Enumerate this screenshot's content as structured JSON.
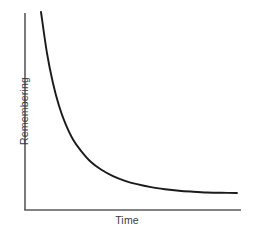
{
  "chart_data": {
    "type": "line",
    "title": "",
    "subtitle": "",
    "xlabel": "Time",
    "ylabel": "Remembering",
    "grid": false,
    "legend": null,
    "ticks": {
      "x": [],
      "y": []
    },
    "xlim": [
      0,
      100
    ],
    "ylim": [
      0,
      100
    ],
    "annotations": [],
    "line_color": "#1a1a1a",
    "axis_color": "#5a5a5a",
    "background_color": "#ffffff",
    "series": [
      {
        "name": "Forgetting curve",
        "x": [
          2,
          5,
          8,
          11,
          14,
          18,
          22,
          27,
          32,
          38,
          44,
          50,
          57,
          64,
          71,
          78,
          85,
          92,
          100
        ],
        "y": [
          100,
          78,
          62,
          50,
          41,
          32,
          26,
          20,
          16,
          12.5,
          10,
          8.2,
          6.6,
          5.5,
          4.7,
          4.2,
          3.8,
          3.6,
          3.5
        ]
      }
    ]
  },
  "figure": {
    "x_axis_label": "Time",
    "y_axis_label": "Remembering"
  }
}
